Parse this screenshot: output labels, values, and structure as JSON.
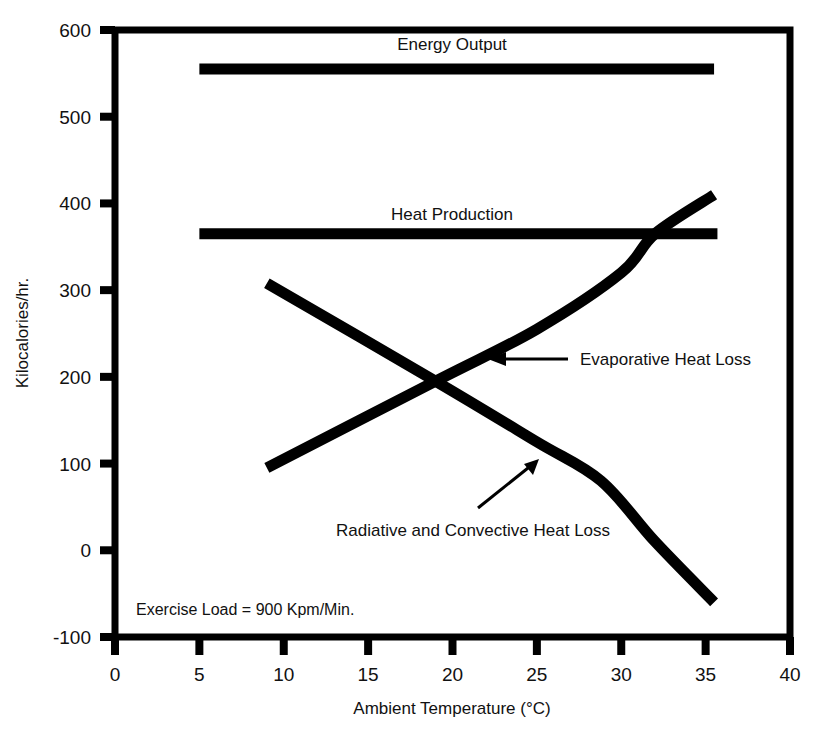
{
  "chart_data": {
    "type": "line",
    "title": "",
    "xlabel": "Ambient Temperature (°C)",
    "ylabel": "Kilocalories/hr.",
    "xlim": [
      0,
      40
    ],
    "ylim": [
      -100,
      600
    ],
    "xticks": [
      "0",
      "5",
      "10",
      "15",
      "20",
      "25",
      "30",
      "35",
      "40"
    ],
    "xtick_values": [
      0,
      5,
      10,
      15,
      20,
      25,
      30,
      35,
      40
    ],
    "yticks": [
      "600",
      "500",
      "400",
      "300",
      "200",
      "100",
      "0",
      "-100"
    ],
    "ytick_values": [
      600,
      500,
      400,
      300,
      200,
      100,
      0,
      -100
    ],
    "grid": false,
    "legend_position": "inline-annotations",
    "line_color": "#000000",
    "frame_color": "#000000",
    "background": "#ffffff",
    "annotation": "Exercise Load = 900 Kpm/Min.",
    "series": [
      {
        "name": "Energy Output",
        "label": "Energy Output",
        "style": "flat",
        "x": [
          5.0,
          35.5
        ],
        "values": [
          555,
          555
        ]
      },
      {
        "name": "Heat Production",
        "label": "Heat Production",
        "style": "flat",
        "x": [
          5.0,
          35.7
        ],
        "values": [
          365,
          365
        ]
      },
      {
        "name": "Evaporative Heat Loss",
        "label": "Evaporative Heat Loss",
        "style": "rising",
        "x": [
          9.0,
          19.0,
          25.0,
          30.0,
          32.0,
          35.5
        ],
        "values": [
          95,
          195,
          255,
          320,
          365,
          410
        ]
      },
      {
        "name": "Radiative and Convective Heat Loss",
        "label": "Radiative and Convective Heat Loss",
        "style": "falling",
        "x": [
          9.0,
          19.0,
          25.0,
          28.8,
          32.0,
          35.5
        ],
        "values": [
          308,
          195,
          125,
          80,
          10,
          -60
        ]
      }
    ]
  },
  "labels": {
    "energy_output": "Energy Output",
    "heat_production": "Heat Production",
    "evaporative": "Evaporative Heat Loss",
    "radiative": "Radiative and Convective Heat Loss",
    "exercise_load": "Exercise Load = 900 Kpm/Min.",
    "x_axis_title": "Ambient Temperature (°C)",
    "y_axis_title": "Kilocalories/hr."
  },
  "ticks": {
    "y": [
      "600",
      "500",
      "400",
      "300",
      "200",
      "100",
      "0",
      "-100"
    ],
    "x": [
      "0",
      "5",
      "10",
      "15",
      "20",
      "25",
      "30",
      "35",
      "40"
    ]
  }
}
